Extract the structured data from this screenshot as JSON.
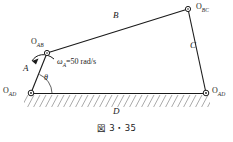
{
  "figure": {
    "caption": "図 3・35",
    "type": "four-bar-linkage-mechanism",
    "background_color": "#ffffff",
    "line_color": "#1a1a1a",
    "joints": [
      {
        "id": "O_AB",
        "label_main": "O",
        "label_sub": "AB",
        "x": 47,
        "y": 53
      },
      {
        "id": "O_BC",
        "label_main": "O",
        "label_sub": "BC",
        "x": 188,
        "y": 9
      },
      {
        "id": "O_AD",
        "label_main": "O",
        "label_sub": "AD",
        "x": 31,
        "y": 93
      },
      {
        "id": "O_CD",
        "label_main": "O",
        "label_sub": "AD",
        "x": 206,
        "y": 93
      }
    ],
    "links": [
      {
        "id": "A",
        "label": "A",
        "from": "O_AD",
        "to": "O_AB",
        "label_x": 26,
        "label_y": 68
      },
      {
        "id": "B",
        "label": "B",
        "from": "O_AB",
        "to": "O_BC",
        "label_x": 116,
        "label_y": 16
      },
      {
        "id": "C",
        "label": "C",
        "from": "O_BC",
        "to": "O_CD",
        "label_x": 192,
        "label_y": 45
      },
      {
        "id": "D",
        "label": "D",
        "from": "O_AD",
        "to": "O_CD",
        "label_x": 116,
        "label_y": 110
      }
    ],
    "annotations": {
      "omega_symbol": "ω",
      "omega_subscript": "A",
      "omega_equals": "=50 rad/s",
      "omega_full": "ωA =50 rad/s",
      "omega_x": 58,
      "omega_y": 59,
      "theta_label": "θ",
      "theta_x": 44,
      "theta_y": 78,
      "rotation_direction": "counterclockwise"
    },
    "ground": {
      "hatching": "diagonal",
      "y_top": 95,
      "y_bottom": 107,
      "x_start": 24,
      "x_end": 210
    }
  }
}
